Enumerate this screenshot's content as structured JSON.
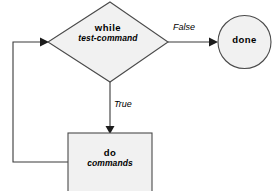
{
  "diagram": {
    "type": "flowchart",
    "palette": {
      "shape_fill": "#f1f1f1",
      "shape_stroke": "#4a4a4a",
      "edge_stroke": "#3a3a3a",
      "arrow_fill": "#1c1c1c",
      "text_color": "#000000",
      "background": "#ffffff"
    },
    "nodes": [
      {
        "id": "while",
        "shape": "diamond",
        "primary_label": "while",
        "secondary_label": "test-command"
      },
      {
        "id": "done",
        "shape": "circle",
        "primary_label": "done",
        "secondary_label": ""
      },
      {
        "id": "do",
        "shape": "rectangle",
        "primary_label": "do",
        "secondary_label": "commands"
      }
    ],
    "edges": [
      {
        "id": "while-to-done",
        "from": "while",
        "to": "done",
        "label": "False"
      },
      {
        "id": "while-to-do",
        "from": "while",
        "to": "do",
        "label": "True"
      },
      {
        "id": "do-to-while",
        "from": "do",
        "to": "while",
        "label": ""
      }
    ]
  }
}
